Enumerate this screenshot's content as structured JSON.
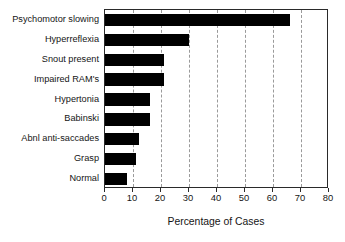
{
  "chart_data": {
    "type": "bar",
    "orientation": "horizontal",
    "title": "",
    "xlabel": "Percentage of Cases",
    "ylabel": "",
    "categories": [
      "Psychomotor slowing",
      "Hyperreflexia",
      "Snout present",
      "Impaired RAM's",
      "Hypertonia",
      "Babinski",
      "Abnl anti-saccades",
      "Grasp",
      "Normal"
    ],
    "values": [
      66,
      30,
      21,
      21,
      16,
      16,
      12,
      11,
      8
    ],
    "xlim": [
      0,
      80
    ],
    "xticks": [
      0,
      10,
      20,
      30,
      40,
      50,
      60,
      70,
      80
    ],
    "xtick_labels": [
      "0",
      "10",
      "20",
      "30",
      "40",
      "50",
      "60",
      "70",
      "80"
    ],
    "grid": "vertical-dashed",
    "legend": "none",
    "bar_color": "#000000",
    "axis_color": "#2a2a2a",
    "grid_color": "#9a9a9a"
  }
}
